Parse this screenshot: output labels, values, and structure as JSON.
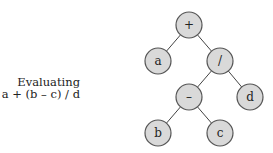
{
  "caption": {
    "line1": "Evaluating",
    "line2": "a + (b – c) / d"
  },
  "tree": {
    "nodes": [
      {
        "id": "plus",
        "label": "+",
        "x": 189,
        "y": 25
      },
      {
        "id": "a",
        "label": "a",
        "x": 158,
        "y": 61
      },
      {
        "id": "div",
        "label": "/",
        "x": 220,
        "y": 61
      },
      {
        "id": "minus",
        "label": "–",
        "x": 189,
        "y": 97
      },
      {
        "id": "d",
        "label": "d",
        "x": 250,
        "y": 97
      },
      {
        "id": "b",
        "label": "b",
        "x": 158,
        "y": 133
      },
      {
        "id": "c",
        "label": "c",
        "x": 220,
        "y": 133
      }
    ],
    "edges": [
      [
        "plus",
        "a"
      ],
      [
        "plus",
        "div"
      ],
      [
        "div",
        "minus"
      ],
      [
        "div",
        "d"
      ],
      [
        "minus",
        "b"
      ],
      [
        "minus",
        "c"
      ]
    ],
    "node_fill": "#d9d9d9",
    "node_stroke": "#555555"
  }
}
